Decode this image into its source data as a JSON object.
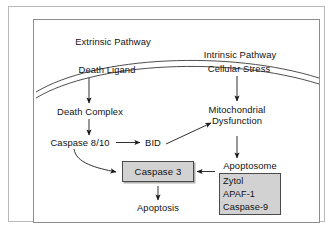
{
  "figure": {
    "background_color": "#ffffff",
    "frame_color": "#b9b9b9",
    "panel_border_color": "#8d8d8d",
    "text_color": "#121212",
    "node_fill_color": "#d2d2d2",
    "node_border_color": "#4a4a4a"
  },
  "pathways": {
    "extrinsic_heading": "Extrinsic Pathway",
    "intrinsic_heading": "Intrinsic Pathway"
  },
  "nodes": {
    "death_ligand": "Death Ligand",
    "cellular_stress": "Cellular Stress",
    "death_complex": "Death Complex",
    "caspase_8_10": "Caspase 8/10",
    "bid": "BID",
    "mitochondrial_line1": "Mitochondrial",
    "mitochondrial_line2": "Dysfunction",
    "apoptosome_label": "Apoptosome",
    "caspase_3": "Caspase 3",
    "apoptosis": "Apoptosis"
  },
  "apoptosome_components": [
    "Zytol",
    "APAF-1",
    "Caspase-9"
  ],
  "membrane": {
    "name": "cell-membrane",
    "style": "double-curved-line"
  },
  "edges": [
    {
      "from": "Death Ligand",
      "to": "Death Complex",
      "type": "straight-down"
    },
    {
      "from": "Cellular Stress",
      "to": "Mitochondrial Dysfunction",
      "type": "straight-down"
    },
    {
      "from": "Death Complex",
      "to": "Caspase 8/10",
      "type": "straight-down"
    },
    {
      "from": "Caspase 8/10",
      "to": "BID",
      "type": "straight-right"
    },
    {
      "from": "BID",
      "to": "Mitochondrial Dysfunction",
      "type": "diagonal-up-right"
    },
    {
      "from": "Caspase 8/10",
      "to": "Caspase 3",
      "type": "curved-down-right"
    },
    {
      "from": "Mitochondrial Dysfunction",
      "to": "Apoptosome",
      "type": "straight-down"
    },
    {
      "from": "Apoptosome",
      "to": "Caspase 3",
      "type": "straight-left"
    },
    {
      "from": "Caspase 3",
      "to": "Apoptosis",
      "type": "straight-down"
    }
  ]
}
